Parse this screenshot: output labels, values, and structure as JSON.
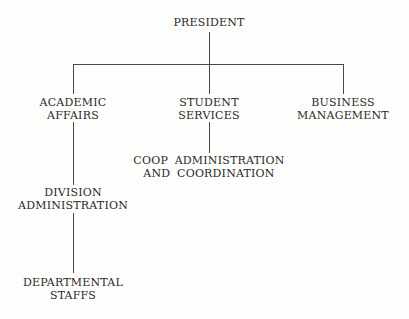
{
  "diagram": {
    "type": "org-chart",
    "nodes": {
      "president": {
        "lines": [
          "PRESIDENT"
        ]
      },
      "academic_affairs": {
        "lines": [
          "ACADEMIC",
          "AFFAIRS"
        ]
      },
      "student_services": {
        "lines": [
          "STUDENT",
          "SERVICES"
        ]
      },
      "business_management": {
        "lines": [
          "BUSINESS",
          "MANAGEMENT"
        ]
      },
      "coop_admin": {
        "lines": [
          "COOP ADMINISTRATION",
          "AND COORDINATION"
        ]
      },
      "division_admin": {
        "lines": [
          "DIVISION",
          "ADMINISTRATION"
        ]
      },
      "departmental_staffs": {
        "lines": [
          "DEPARTMENTAL",
          "STAFFS"
        ]
      }
    },
    "edges": [
      [
        "president",
        "academic_affairs"
      ],
      [
        "president",
        "student_services"
      ],
      [
        "president",
        "business_management"
      ],
      [
        "student_services",
        "coop_admin"
      ],
      [
        "academic_affairs",
        "division_admin"
      ],
      [
        "division_admin",
        "departmental_staffs"
      ]
    ]
  }
}
